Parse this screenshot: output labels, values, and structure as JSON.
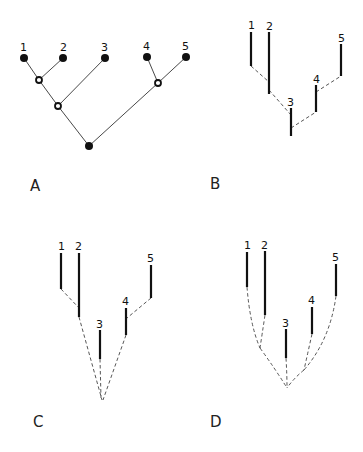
{
  "figure": {
    "panels": [
      {
        "id": "A",
        "letter": "A",
        "type": "cladogram-with-nodes",
        "tips": [
          {
            "label": "1",
            "x": 24,
            "y": 58
          },
          {
            "label": "2",
            "x": 63,
            "y": 58
          },
          {
            "label": "3",
            "x": 105,
            "y": 58
          },
          {
            "label": "4",
            "x": 147,
            "y": 57
          },
          {
            "label": "5",
            "x": 186,
            "y": 57
          }
        ],
        "internal_nodes": [
          {
            "id": "n12",
            "kind": "open",
            "x": 39,
            "y": 80
          },
          {
            "id": "n123",
            "kind": "open",
            "x": 58,
            "y": 106
          },
          {
            "id": "n45",
            "kind": "open",
            "x": 158,
            "y": 83
          },
          {
            "id": "root",
            "kind": "filled",
            "x": 89,
            "y": 146
          }
        ]
      },
      {
        "id": "B",
        "letter": "B",
        "type": "stratigraphic-lineages",
        "lineages": [
          {
            "label": "1",
            "x": 251,
            "y_top": 32,
            "y_bottom": 66
          },
          {
            "label": "2",
            "x": 269,
            "y_top": 32,
            "y_bottom": 94
          },
          {
            "label": "3",
            "x": 291,
            "y_top": 108,
            "y_bottom": 136
          },
          {
            "label": "4",
            "x": 316,
            "y_top": 85,
            "y_bottom": 112
          },
          {
            "label": "5",
            "x": 341,
            "y_top": 44,
            "y_bottom": 76
          }
        ]
      },
      {
        "id": "C",
        "letter": "C",
        "type": "stratigraphic-lineages",
        "lineages": [
          {
            "label": "1",
            "x": 61,
            "y_top": 253,
            "y_bottom": 289
          },
          {
            "label": "2",
            "x": 79,
            "y_top": 253,
            "y_bottom": 317
          },
          {
            "label": "3",
            "x": 100,
            "y_top": 330,
            "y_bottom": 359
          },
          {
            "label": "4",
            "x": 126,
            "y_top": 308,
            "y_bottom": 335
          },
          {
            "label": "5",
            "x": 151,
            "y_top": 265,
            "y_bottom": 298
          }
        ]
      },
      {
        "id": "D",
        "letter": "D",
        "type": "stratigraphic-lineages",
        "lineages": [
          {
            "label": "1",
            "x": 247,
            "y_top": 252,
            "y_bottom": 287
          },
          {
            "label": "2",
            "x": 265,
            "y_top": 251,
            "y_bottom": 315
          },
          {
            "label": "3",
            "x": 286,
            "y_top": 329,
            "y_bottom": 358
          },
          {
            "label": "4",
            "x": 312,
            "y_top": 307,
            "y_bottom": 334
          },
          {
            "label": "5",
            "x": 336,
            "y_top": 264,
            "y_bottom": 296
          }
        ]
      }
    ]
  }
}
